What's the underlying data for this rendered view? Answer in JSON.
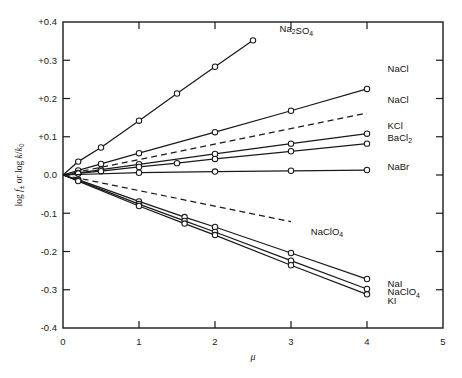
{
  "chart_data": {
    "type": "line",
    "title": "",
    "xlabel": "μ",
    "ylabel": "log f± or log k/k0",
    "xlim": [
      0,
      5
    ],
    "ylim": [
      -0.4,
      0.4
    ],
    "grid": false,
    "legend_position": "inline-right-of-curve-end",
    "xticks": [
      "0",
      "1",
      "2",
      "3",
      "4",
      "5"
    ],
    "xtick_values": [
      0,
      1,
      2,
      3,
      4,
      5
    ],
    "yticks": [
      "+0.4",
      "+0.3",
      "+0.2",
      "+0.1",
      "0.0",
      "-0.1",
      "-0.2",
      "-0.3",
      "-0.4"
    ],
    "ytick_values": [
      0.4,
      0.3,
      0.2,
      0.1,
      0.0,
      -0.1,
      -0.2,
      -0.3,
      -0.4
    ],
    "marker": "open-circle",
    "series": [
      {
        "name": "Na2SO4",
        "label": "Na₂SO₄",
        "style": "solid",
        "label_x": 2.85,
        "label_y": 0.383,
        "x": [
          0,
          0.2,
          0.5,
          1.0,
          1.5,
          2.0,
          2.5
        ],
        "y": [
          0.0,
          0.035,
          0.072,
          0.142,
          0.213,
          0.283,
          0.352
        ]
      },
      {
        "name": "NaCl-solid",
        "label": "NaCl",
        "style": "solid",
        "label_x": 4.27,
        "label_y": 0.277,
        "x": [
          0,
          0.2,
          0.5,
          1.0,
          2.0,
          3.0,
          4.0
        ],
        "y": [
          0.0,
          0.012,
          0.029,
          0.057,
          0.112,
          0.168,
          0.225
        ]
      },
      {
        "name": "NaCl-dashed",
        "label": "NaCl",
        "style": "dashed",
        "label_x": 4.27,
        "label_y": 0.196,
        "x": [
          0,
          4.0
        ],
        "y": [
          0.0,
          0.162
        ]
      },
      {
        "name": "KCl",
        "label": "KCl",
        "style": "solid",
        "label_x": 4.27,
        "label_y": 0.128,
        "x": [
          0,
          0.2,
          0.5,
          1.0,
          2.0,
          3.0,
          4.0
        ],
        "y": [
          0.0,
          0.005,
          0.014,
          0.028,
          0.055,
          0.082,
          0.108
        ]
      },
      {
        "name": "BaCl2",
        "label": "BaCl₂",
        "style": "solid",
        "label_x": 4.27,
        "label_y": 0.098,
        "x": [
          0,
          0.2,
          0.5,
          1.0,
          1.5,
          2.0,
          3.0,
          4.0
        ],
        "y": [
          0.0,
          0.004,
          0.01,
          0.021,
          0.031,
          0.042,
          0.062,
          0.082
        ]
      },
      {
        "name": "NaBr",
        "label": "NaBr",
        "style": "solid",
        "label_x": 4.27,
        "label_y": 0.022,
        "x": [
          0,
          1.0,
          2.0,
          3.0,
          4.0
        ],
        "y": [
          0.0,
          0.006,
          0.009,
          0.011,
          0.013
        ]
      },
      {
        "name": "NaClO4-dashed",
        "label": "NaClO₄",
        "style": "dashed",
        "label_x": 3.26,
        "label_y": -0.148,
        "x": [
          0,
          3.0
        ],
        "y": [
          0.0,
          -0.122
        ]
      },
      {
        "name": "NaI",
        "label": "NaI",
        "style": "solid",
        "label_x": 4.27,
        "label_y": -0.283,
        "x": [
          0,
          0.2,
          1.0,
          1.6,
          2.0,
          3.0,
          4.0
        ],
        "y": [
          0.0,
          -0.012,
          -0.069,
          -0.11,
          -0.136,
          -0.204,
          -0.272
        ]
      },
      {
        "name": "NaClO4",
        "label": "NaClO₄",
        "style": "solid",
        "label_x": 4.27,
        "label_y": -0.306,
        "x": [
          0,
          0.2,
          1.0,
          1.6,
          2.0,
          3.0,
          4.0
        ],
        "y": [
          0.0,
          -0.014,
          -0.076,
          -0.12,
          -0.149,
          -0.224,
          -0.298
        ]
      },
      {
        "name": "KI",
        "label": "KI",
        "style": "solid",
        "label_x": 4.27,
        "label_y": -0.329,
        "x": [
          0,
          0.2,
          1.0,
          1.6,
          2.0,
          3.0,
          4.0
        ],
        "y": [
          0.0,
          -0.016,
          -0.081,
          -0.127,
          -0.157,
          -0.236,
          -0.312
        ]
      }
    ]
  },
  "axis": {
    "y_label_main": "log",
    "y_label_f": "f",
    "y_label_pm": "±",
    "y_label_or": " or log ",
    "y_label_k": "k",
    "y_label_slash": "/",
    "y_label_k0": "k",
    "y_label_zero": "0",
    "x_label": "μ"
  }
}
